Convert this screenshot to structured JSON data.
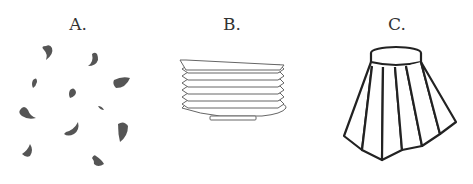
{
  "figure": {
    "panels": [
      {
        "label": "A.",
        "subject": "scattered petals"
      },
      {
        "label": "B.",
        "subject": "stack of plates"
      },
      {
        "label": "C.",
        "subject": "pleated skirt"
      }
    ],
    "colors": {
      "petal": "#555555",
      "line": "#222222",
      "plate_line": "#666666"
    }
  }
}
